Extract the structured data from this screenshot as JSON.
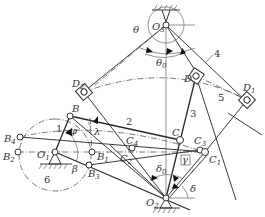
{
  "figure": {
    "type": "linkage-mechanism-diagram",
    "points": {
      "O3": {
        "name": "O",
        "sub": "3"
      },
      "O2": {
        "name": "O",
        "sub": "2"
      },
      "O1": {
        "name": "O",
        "sub": "1"
      },
      "B": {
        "name": "B",
        "sub": ""
      },
      "B1": {
        "name": "B",
        "sub": "1"
      },
      "B2": {
        "name": "B",
        "sub": "2"
      },
      "B3": {
        "name": "B",
        "sub": "3"
      },
      "B4": {
        "name": "B",
        "sub": "4"
      },
      "C": {
        "name": "C",
        "sub": ""
      },
      "C1": {
        "name": "C",
        "sub": "1"
      },
      "C2": {
        "name": "C",
        "sub": "2"
      },
      "C3": {
        "name": "C",
        "sub": "3"
      },
      "C4": {
        "name": "C",
        "sub": "4"
      },
      "D": {
        "name": "D",
        "sub": ""
      },
      "D1": {
        "name": "D",
        "sub": "1"
      },
      "D2": {
        "name": "D",
        "sub": "2"
      }
    },
    "angles": {
      "theta": "θ",
      "theta0": {
        "name": "θ",
        "sub": "0"
      },
      "phi": "φ",
      "lambda": "λ",
      "beta": "β",
      "gamma": "γ",
      "delta": "δ",
      "delta0": {
        "name": "δ",
        "sub": "0"
      }
    },
    "links": [
      "1",
      "2",
      "3",
      "4",
      "5",
      "6"
    ]
  }
}
